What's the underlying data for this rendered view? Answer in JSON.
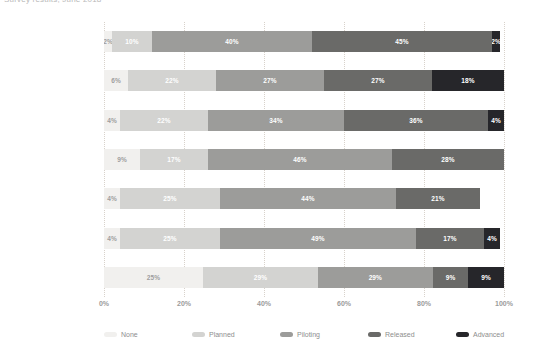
{
  "header": {
    "text": "Survey results, June 2018"
  },
  "chart_data": {
    "type": "bar",
    "orientation": "horizontal",
    "stacked": true,
    "normalized_percent": true,
    "title": "",
    "xlabel": "",
    "ylabel": "",
    "xlim": [
      0,
      100
    ],
    "xticks": [
      "0%",
      "20%",
      "40%",
      "60%",
      "80%",
      "100%"
    ],
    "xtick_values": [
      0,
      20,
      40,
      60,
      80,
      100
    ],
    "grid": true,
    "grid_axis": "x",
    "legend_position": "bottom",
    "categories": [
      "TMT",
      "Services",
      "Finance",
      "Infrastructure",
      "Industrial Products",
      "Life Science",
      "CPR"
    ],
    "series": [
      {
        "name": "None",
        "color": "#f1f0ee",
        "values": [
          2,
          6,
          4,
          9,
          4,
          4,
          25
        ]
      },
      {
        "name": "Planned",
        "color": "#d3d3d1",
        "values": [
          10,
          22,
          22,
          17,
          25,
          25,
          29
        ]
      },
      {
        "name": "Piloting",
        "color": "#9c9c9a",
        "values": [
          40,
          27,
          34,
          46,
          44,
          49,
          29
        ]
      },
      {
        "name": "Released",
        "color": "#6a6a68",
        "values": [
          45,
          27,
          36,
          28,
          21,
          17,
          9
        ]
      },
      {
        "name": "Advanced",
        "color": "#26262a",
        "values": [
          2,
          18,
          4,
          0,
          0,
          4,
          9
        ]
      }
    ],
    "bar_labels": [
      [
        "2%",
        "10%",
        "40%",
        "45%",
        "2%"
      ],
      [
        "6%",
        "22%",
        "27%",
        "27%",
        "18%"
      ],
      [
        "4%",
        "22%",
        "34%",
        "36%",
        "4%"
      ],
      [
        "9%",
        "17%",
        "46%",
        "28%",
        ""
      ],
      [
        "4%",
        "25%",
        "44%",
        "21%",
        ""
      ],
      [
        "4%",
        "25%",
        "49%",
        "17%",
        "4%"
      ],
      [
        "25%",
        "29%",
        "29%",
        "9%",
        "9%"
      ]
    ]
  }
}
